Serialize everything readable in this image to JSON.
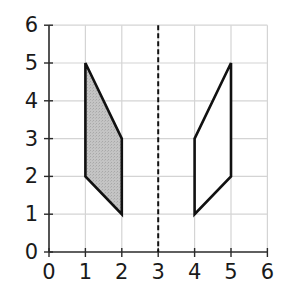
{
  "figure": {
    "axes": {
      "x_ticks": [
        "0",
        "1",
        "2",
        "3",
        "4",
        "5",
        "6"
      ],
      "y_ticks": [
        "0",
        "1",
        "2",
        "3",
        "4",
        "5",
        "6"
      ],
      "x_range": [
        0,
        6
      ],
      "y_range": [
        0,
        6
      ],
      "grid": true
    },
    "mirror_line": {
      "type": "dashed",
      "x": 3
    },
    "shapes": [
      {
        "name": "original",
        "shaded": true,
        "fill": "#c4c4c4",
        "vertices": [
          [
            1,
            5
          ],
          [
            2,
            3
          ],
          [
            2,
            1
          ],
          [
            1,
            2
          ]
        ]
      },
      {
        "name": "reflection",
        "shaded": false,
        "fill": "#ffffff",
        "vertices": [
          [
            5,
            5
          ],
          [
            4,
            3
          ],
          [
            4,
            1
          ],
          [
            5,
            2
          ]
        ]
      }
    ],
    "colors": {
      "grid": "#d4d4d4",
      "axis": "#2a2a2a",
      "outline": "#111111"
    }
  }
}
